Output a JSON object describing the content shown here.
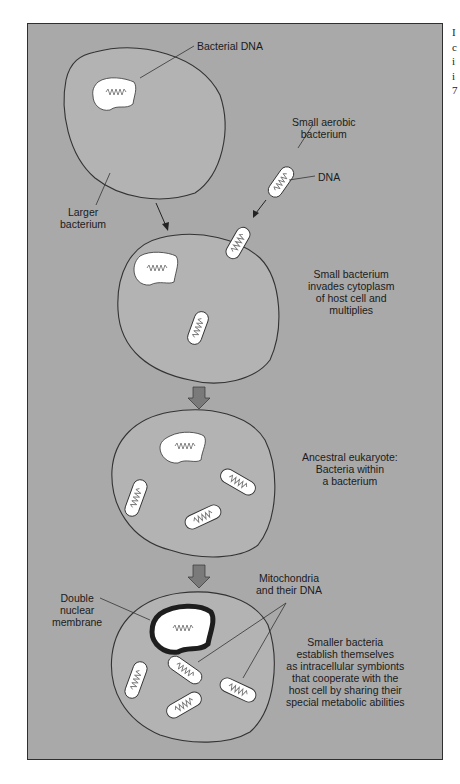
{
  "figure": {
    "colors": {
      "panel": "#a9a9a9",
      "cell_fill": "#b3b3b3",
      "outline": "#333333",
      "nucleoid": "#ffffff",
      "arrow": "#7a7a7a",
      "nuclear_membrane": "#1e1e1e"
    },
    "labels": {
      "bacterial_dna": "Bacterial DNA",
      "small_aerobic_1": "Small aerobic",
      "small_aerobic_2": "bacterium",
      "dna": "DNA",
      "larger_1": "Larger",
      "larger_2": "bacterium",
      "step2_1": "Small bacterium",
      "step2_2": "invades cytoplasm",
      "step2_3": "of host cell and",
      "step2_4": "multiplies",
      "step3_1": "Ancestral eukaryote:",
      "step3_2": "Bacteria within",
      "step3_3": "a bacterium",
      "mito_1": "Mitochondria",
      "mito_2": "and their DNA",
      "double_1": "Double",
      "double_2": "nuclear",
      "double_3": "membrane",
      "step4_1": "Smaller bacteria",
      "step4_2": "establish themselves",
      "step4_3": "as intracellular symbionts",
      "step4_4": "that cooperate with the",
      "step4_5": "host cell by sharing their",
      "step4_6": "special metabolic abilities"
    },
    "side_text": [
      "I",
      "c",
      "i",
      "i",
      "7"
    ]
  }
}
